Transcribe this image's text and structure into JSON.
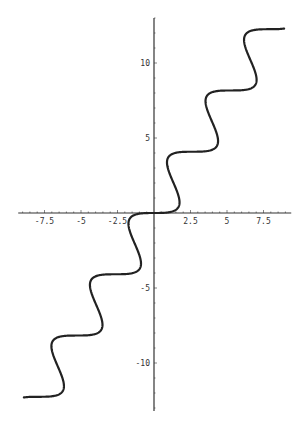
{
  "chart_data": {
    "type": "line",
    "title": "",
    "xlabel": "",
    "ylabel": "",
    "parametric": {
      "x": "0.42*t + sin(t)",
      "y": "0.65*(t - sin(t))",
      "t_range": [
        -19.6,
        19.6
      ]
    },
    "xlim": [
      -9.3,
      9.4
    ],
    "ylim": [
      -13.2,
      13.0
    ],
    "xticks": [
      -7.5,
      -5,
      -2.5,
      2.5,
      5,
      7.5
    ],
    "xtick_labels": [
      "-7.5",
      "-5",
      "-2.5",
      "2.5",
      "5",
      "7.5"
    ],
    "yticks": [
      -10,
      -5,
      5,
      10
    ],
    "ytick_labels": [
      "-10",
      "-5",
      "5",
      "10"
    ],
    "grid": false,
    "legend": null,
    "sample_points": [
      {
        "x": -8.6,
        "y": -12.3
      },
      {
        "x": -6.5,
        "y": -10.2
      },
      {
        "x": -5.2,
        "y": -8.2
      },
      {
        "x": -3.9,
        "y": -6.1
      },
      {
        "x": -2.6,
        "y": -4.1
      },
      {
        "x": -1.3,
        "y": -2.0
      },
      {
        "x": 0,
        "y": 0
      },
      {
        "x": 1.3,
        "y": 2.0
      },
      {
        "x": 2.6,
        "y": 4.1
      },
      {
        "x": 3.9,
        "y": 6.1
      },
      {
        "x": 5.2,
        "y": 8.2
      },
      {
        "x": 6.5,
        "y": 10.2
      },
      {
        "x": 8.6,
        "y": 12.3
      }
    ],
    "colors": {
      "curve": "#222222",
      "axes": "#333333"
    }
  }
}
